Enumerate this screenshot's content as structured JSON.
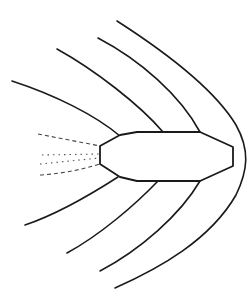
{
  "diagram": {
    "title": "",
    "colors": {
      "background": "#ffffff",
      "stroke": "#1a1a1a",
      "wake": "#555555"
    },
    "elements": {
      "body": {
        "label": "",
        "shape": "octagonal-capsule"
      },
      "bow_shock": {
        "label": ""
      },
      "flow_lines_upper": {
        "count": 3
      },
      "flow_lines_lower": {
        "count": 3
      },
      "wake": {
        "label": "",
        "style": "dashed-and-dotted"
      }
    }
  }
}
